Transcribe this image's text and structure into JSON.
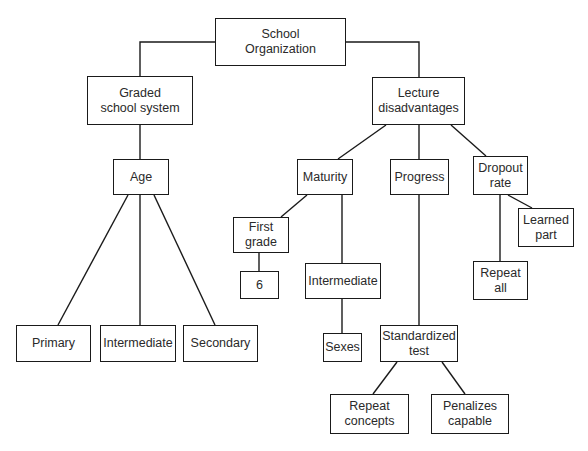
{
  "diagram": {
    "type": "tree",
    "root": "School Organization",
    "nodes": {
      "root": {
        "label": "School\nOrganization"
      },
      "graded": {
        "label": "Graded\nschool system"
      },
      "lecture": {
        "label": "Lecture\ndisadvantages"
      },
      "age": {
        "label": "Age"
      },
      "primary": {
        "label": "Primary"
      },
      "intermediate_age": {
        "label": "Intermediate"
      },
      "secondary": {
        "label": "Secondary"
      },
      "maturity": {
        "label": "Maturity"
      },
      "progress": {
        "label": "Progress"
      },
      "dropout": {
        "label": "Dropout\nrate"
      },
      "first_grade": {
        "label": "First\ngrade"
      },
      "six": {
        "label": "6"
      },
      "intermediate_maturity": {
        "label": "Intermediate"
      },
      "sexes": {
        "label": "Sexes"
      },
      "standardized": {
        "label": "Standardized\ntest"
      },
      "repeat_concepts": {
        "label": "Repeat\nconcepts"
      },
      "penalizes": {
        "label": "Penalizes\ncapable"
      },
      "learned_part": {
        "label": "Learned\npart"
      },
      "repeat_all": {
        "label": "Repeat\nall"
      }
    },
    "edges": [
      [
        "School Organization",
        "Graded school system"
      ],
      [
        "School Organization",
        "Lecture disadvantages"
      ],
      [
        "Graded school system",
        "Age"
      ],
      [
        "Age",
        "Primary"
      ],
      [
        "Age",
        "Intermediate"
      ],
      [
        "Age",
        "Secondary"
      ],
      [
        "Lecture disadvantages",
        "Maturity"
      ],
      [
        "Lecture disadvantages",
        "Progress"
      ],
      [
        "Lecture disadvantages",
        "Dropout rate"
      ],
      [
        "Maturity",
        "First grade"
      ],
      [
        "First grade",
        "6"
      ],
      [
        "Maturity",
        "Intermediate"
      ],
      [
        "Intermediate",
        "Sexes"
      ],
      [
        "Progress",
        "Standardized test"
      ],
      [
        "Standardized test",
        "Repeat concepts"
      ],
      [
        "Standardized test",
        "Penalizes capable"
      ],
      [
        "Dropout rate",
        "Learned part"
      ],
      [
        "Dropout rate",
        "Repeat all"
      ]
    ]
  }
}
